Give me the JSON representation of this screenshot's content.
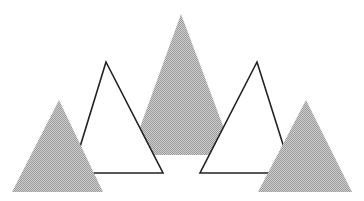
{
  "illustration": {
    "background": "#ffffff",
    "fill_color": "#bdbdbd",
    "fill_dot_color": "#8f8f8f",
    "stroke_color": "#222222",
    "shapes": [
      {
        "name": "center-shaded-triangle",
        "kind": "shaded",
        "points": "181,14 130,155 234,155"
      },
      {
        "name": "left-outline-triangle",
        "kind": "outline",
        "points": "106,62 72,173 163,173"
      },
      {
        "name": "right-outline-triangle",
        "kind": "outline",
        "points": "257,62 200,173 292,173"
      },
      {
        "name": "left-shaded-triangle",
        "kind": "shaded",
        "points": "59,100 12,192 103,192"
      },
      {
        "name": "right-shaded-triangle",
        "kind": "shaded",
        "points": "306,100 258,192 352,192"
      }
    ]
  }
}
